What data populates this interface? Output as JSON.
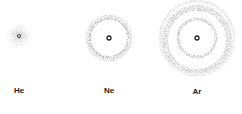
{
  "atoms": [
    {
      "symbol": "He",
      "cx": 19,
      "cy": 36,
      "shells": [
        {
          "r": 0,
          "spread": 14
        }
      ]
    },
    {
      "symbol": "Ne",
      "cx": 109,
      "cy": 38,
      "shells": [
        {
          "r": 0,
          "spread": 3
        },
        {
          "r": 20,
          "spread": 4
        }
      ]
    },
    {
      "symbol": "Ar",
      "cx": 197,
      "cy": 38,
      "shells": [
        {
          "r": 0,
          "spread": 3
        },
        {
          "r": 19,
          "spread": 4
        },
        {
          "r": 35,
          "spread": 6
        }
      ]
    }
  ],
  "labels": {
    "he": "He",
    "ne": "Ne",
    "ar": "Ar"
  }
}
